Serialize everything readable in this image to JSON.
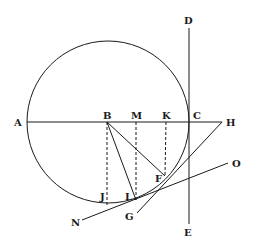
{
  "diagram": {
    "type": "geometric-construction",
    "colors": {
      "stroke": "#1a1a1a",
      "background": "#ffffff"
    },
    "circle": {
      "cx": 108,
      "cy": 122,
      "r": 81
    },
    "points": {
      "A": {
        "label": "A",
        "x": 27,
        "y": 122,
        "lx": 14,
        "ly": 126
      },
      "B": {
        "label": "B",
        "x": 107,
        "y": 122,
        "lx": 103,
        "ly": 119
      },
      "M": {
        "label": "M",
        "x": 136,
        "y": 122,
        "lx": 131,
        "ly": 119
      },
      "K": {
        "label": "K",
        "x": 166,
        "y": 122,
        "lx": 162,
        "ly": 119
      },
      "C": {
        "label": "C",
        "x": 189,
        "y": 122,
        "lx": 193,
        "ly": 119
      },
      "H": {
        "label": "H",
        "x": 222,
        "y": 122,
        "lx": 226,
        "ly": 126
      },
      "D": {
        "label": "D",
        "x": 189,
        "y": 28,
        "lx": 184,
        "ly": 24
      },
      "E": {
        "label": "E",
        "x": 189,
        "y": 224,
        "lx": 184,
        "ly": 236
      },
      "F": {
        "label": "F",
        "x": 165,
        "y": 176,
        "lx": 155,
        "ly": 182
      },
      "L": {
        "label": "L",
        "x": 136,
        "y": 200,
        "lx": 125,
        "ly": 200
      },
      "J": {
        "label": "J",
        "x": 107,
        "y": 205,
        "lx": 100,
        "ly": 200
      },
      "G": {
        "label": "G",
        "x": 137,
        "y": 213,
        "lx": 125,
        "ly": 220
      },
      "N": {
        "label": "N",
        "x": 82,
        "y": 220,
        "lx": 71,
        "ly": 226
      },
      "O": {
        "label": "O",
        "x": 228,
        "y": 163,
        "lx": 232,
        "ly": 167
      }
    },
    "solid_lines": [
      [
        "A",
        "H"
      ],
      [
        "D",
        "E"
      ],
      [
        "B",
        "F"
      ],
      [
        "B",
        "L"
      ],
      [
        "H",
        "G"
      ],
      [
        "N",
        "O"
      ]
    ],
    "dashed_lines": [
      [
        "B",
        "J"
      ],
      [
        "M",
        "L"
      ],
      [
        "K",
        "F"
      ]
    ]
  }
}
